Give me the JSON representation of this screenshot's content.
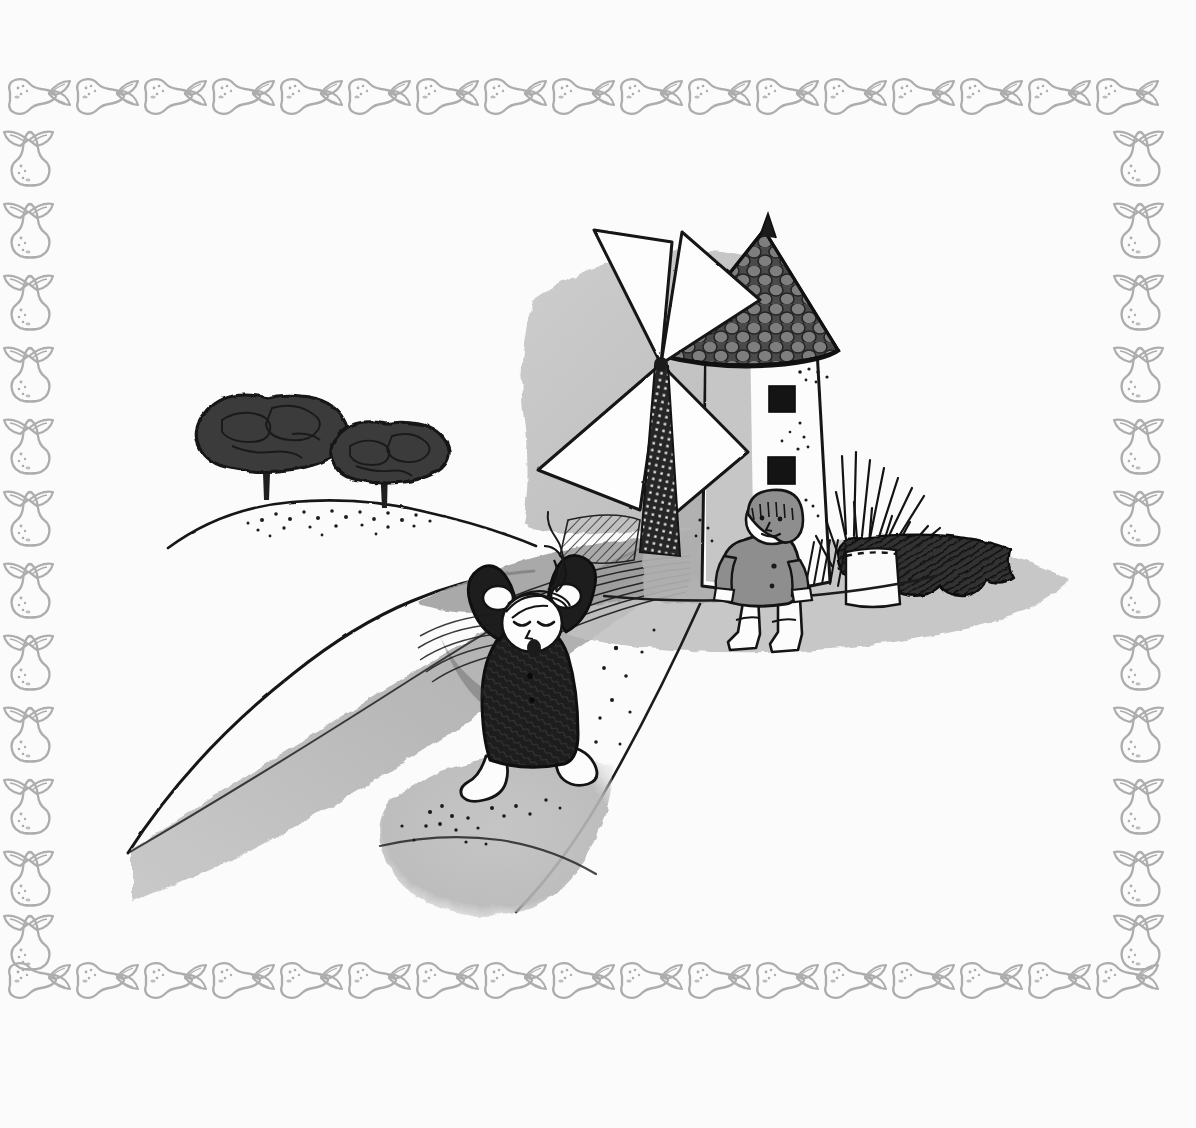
{
  "artwork": {
    "title": "Two children by a windmill on a windy hill",
    "medium": "pen-and-ink with grey wash",
    "canvas": {
      "width": 1196,
      "height": 1128
    },
    "paper_color": "#fbfbfb"
  },
  "palette": {
    "paper": "#fbfbfb",
    "ink": "#1a1a1a",
    "ink_soft": "#2b2b2b",
    "border_gray": "#a9a9a9",
    "wash_light": "#cfcfcf",
    "wash_mid": "#b4b4b4",
    "wash_dark": "#8e8e8e",
    "wash_deep": "#6d6d6d",
    "tree_dark": "#3b3b3b",
    "coat_dark": "#1f1f1f",
    "coat_gray": "#8a8a8a",
    "white": "#ffffff"
  },
  "border": {
    "name": "pear-and-leaf decorative frame",
    "motif": "pear",
    "leaf_count_per_node": 2,
    "line_color": "#a9a9a9",
    "stroke_width": 2.4,
    "inset_left": 18,
    "inset_top": 72,
    "inset_right": 1178,
    "inset_bottom": 1010,
    "top_pear_count": 16,
    "bottom_pear_count": 16,
    "left_pear_count": 12,
    "right_pear_count": 12,
    "pear_orientation_horizontal": "lying on side, stem to the right",
    "pear_orientation_vertical": "upright, stem up"
  },
  "scene": {
    "name": "windmill-landscape",
    "frame": {
      "x": 120,
      "y": 120,
      "width": 940,
      "height": 840
    },
    "sky_color": "#fbfbfb",
    "elements": [
      "hill",
      "two-trees",
      "windmill",
      "wind-gust-shadow",
      "child-shouting",
      "child-standing",
      "dark-bush",
      "grass-hatching"
    ]
  },
  "hill": {
    "name": "rolling-hill",
    "contour_color": "#1a1a1a",
    "stipple": true,
    "stipple_dot_count": 60,
    "crest_x": 300,
    "crest_y": 505
  },
  "trees": [
    {
      "name": "large-tree",
      "cx": 265,
      "cy": 440,
      "rx": 68,
      "ry": 52,
      "trunk_h": 58,
      "fill": "#3b3b3b"
    },
    {
      "name": "small-tree",
      "cx": 385,
      "cy": 468,
      "rx": 52,
      "ry": 40,
      "trunk_h": 44,
      "fill": "#3b3b3b"
    }
  ],
  "windmill": {
    "name": "windmill",
    "tower": {
      "x": 700,
      "y": 300,
      "width": 140,
      "height": 290,
      "fill": "#ffffff",
      "outline": "#1a1a1a"
    },
    "roof": {
      "shape": "cone",
      "apex_x": 762,
      "apex_y": 232,
      "fill": "#555555",
      "tile_pattern": "round stones",
      "tile_rows": 9
    },
    "windows": [
      {
        "name": "upper-window",
        "x": 769,
        "y": 388,
        "w": 24,
        "h": 24,
        "fill": "#151515"
      },
      {
        "name": "lower-window",
        "x": 769,
        "y": 459,
        "w": 24,
        "h": 24,
        "fill": "#151515"
      }
    ],
    "sails": {
      "count": 4,
      "hub_x": 661,
      "hub_y": 364,
      "blade_fill": "#ffffff",
      "blade_outline": "#1a1a1a",
      "lattice_fill": "#1f1f1f"
    },
    "base_wash": "#b4b4b4"
  },
  "children": [
    {
      "name": "child-shouting",
      "pose": "hands raised to head, mouth open, eyes closed, hair blowing",
      "coat_color": "#1f1f1f",
      "face_color": "#ffffff",
      "boots_color": "#ffffff",
      "x": 470,
      "y": 580,
      "width": 130,
      "height": 215
    },
    {
      "name": "child-standing",
      "pose": "standing still, arms at sides, wearing cap",
      "coat_color": "#8a8a8a",
      "face_color": "#ffffff",
      "boots_color": "#ffffff",
      "cap_color": "#8a8a8a",
      "x": 730,
      "y": 495,
      "width": 92,
      "height": 150
    }
  ],
  "wind": {
    "name": "wind-gust-shadow",
    "description": "long tapering grey wedge sweeping down to the lower left",
    "fill": "#b4b4b4",
    "tip_x": 130,
    "tip_y": 850,
    "wide_x": 700,
    "wide_y": 545
  },
  "bush": {
    "name": "dark-bush",
    "fill": "#3a3a3a",
    "x": 855,
    "y": 520,
    "width": 150,
    "height": 95,
    "hatching": true
  },
  "grass": {
    "name": "grass-hatching",
    "stroke": "#1a1a1a",
    "blade_count": 22,
    "x": 840,
    "y": 440,
    "width": 80,
    "height": 100
  },
  "ground_patches": [
    {
      "name": "foreground-stipple-patch",
      "fill": "#b9b9b9",
      "cx": 500,
      "cy": 815,
      "rx": 110,
      "ry": 70
    },
    {
      "name": "mid-ground-wash",
      "fill": "#c4c4c4",
      "cx": 800,
      "cy": 620,
      "rx": 190,
      "ry": 80
    }
  ]
}
